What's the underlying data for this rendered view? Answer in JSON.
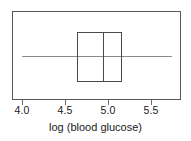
{
  "chart_data": {
    "type": "box",
    "title": "",
    "xlabel": "log (blood glucose)",
    "ylabel": "",
    "xlim": [
      3.87,
      5.84
    ],
    "grid": false,
    "legend": null,
    "orientation": "horizontal",
    "ticks": [
      {
        "label": "4.0",
        "value": 4.0,
        "x": 22
      },
      {
        "label": "4.5",
        "value": 4.5,
        "x": 65
      },
      {
        "label": "5.0",
        "value": 5.0,
        "x": 108
      },
      {
        "label": "5.5",
        "value": 5.5,
        "x": 151
      }
    ],
    "boxes": [
      {
        "name": "log (blood glucose)",
        "whisker_low": 4.0,
        "q1": 4.64,
        "median": 4.94,
        "q3": 5.16,
        "whisker_high": 5.74,
        "outliers": []
      }
    ],
    "colors": {
      "frame": "#575757",
      "box": "#4a4a4a",
      "median": "#4a4a4a",
      "whisker": "#8a8a8a",
      "tick": "#6b6b6b",
      "text": "#1a1a1a",
      "background": "#ffffff"
    }
  }
}
